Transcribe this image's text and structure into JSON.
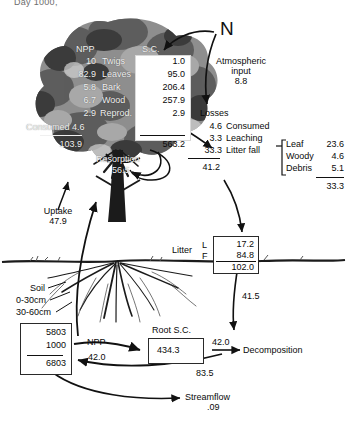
{
  "figure": {
    "top_cut_label": "Day 1000,",
    "title_n": "N"
  },
  "canopy_table": {
    "header_npp": "NPP",
    "header_sc": "S.C.",
    "rows": [
      {
        "npp": "10",
        "name": "Twigs",
        "sc": "1.0"
      },
      {
        "npp": "82.9",
        "name": "Leaves",
        "sc": "95.0"
      },
      {
        "npp": "5.8",
        "name": "Bark",
        "sc": "206.4"
      },
      {
        "npp": "6.7",
        "name": "Wood",
        "sc": "257.9"
      },
      {
        "npp": "2.9",
        "name": "Reprod.",
        "sc": "2.9"
      }
    ],
    "consumed_label": "Consumed 4.6",
    "npp_total": "103.9",
    "sc_total": "563.2",
    "resorption_label": "Resorption",
    "resorption_value": "56.5"
  },
  "atmosphere": {
    "label_line1": "Atmospheric",
    "label_line2": "input",
    "value": "8.8"
  },
  "losses": {
    "header": "Losses",
    "items": [
      {
        "value": "4.6",
        "name": "Consumed"
      },
      {
        "value": "3.3",
        "name": "Leaching"
      },
      {
        "value": "33.3",
        "name": "Litter fall"
      }
    ],
    "total": "41.2"
  },
  "litterfall_breakdown": {
    "rows": [
      {
        "name": "Leaf",
        "value": "23.6"
      },
      {
        "name": "Woody",
        "value": "4.6"
      },
      {
        "name": "Debris",
        "value": "5.1"
      }
    ],
    "total": "33.3"
  },
  "uptake": {
    "label": "Uptake",
    "value": "47.9"
  },
  "litter_box": {
    "label": "Litter",
    "tag_l": "L",
    "tag_f": "F",
    "l_value": "17.2",
    "f_value": "84.8",
    "total": "102.0",
    "outflow": "41.5"
  },
  "soil": {
    "label": "Soil",
    "depth1": "0-30cm",
    "depth2": "30-60cm",
    "value1": "5803",
    "value2": "1000",
    "total": "6803"
  },
  "root": {
    "npp_label": "NPP",
    "npp_value": "42.0",
    "sc_label": "Root S.C.",
    "sc_value": "434.3",
    "turnover": "42.0"
  },
  "decomposition": {
    "label": "Decomposition",
    "to_soil": "83.5"
  },
  "streamflow": {
    "label": "Streamflow",
    "value": ".09"
  },
  "colors": {
    "ink": "#111111",
    "canopy_text": "#f2f2f2",
    "box_fill": "#ffffff"
  }
}
